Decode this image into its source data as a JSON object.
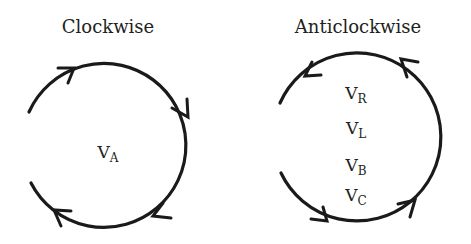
{
  "left_panel": {
    "title": "Clockwise",
    "direction": "clockwise",
    "labels": [
      {
        "main": "V",
        "sub": "A"
      }
    ]
  },
  "right_panel": {
    "title": "Anticlockwise",
    "direction": "anticlockwise",
    "labels": [
      {
        "main": "V",
        "sub": "R"
      },
      {
        "main": "V",
        "sub": "L"
      },
      {
        "main": "V",
        "sub": "B"
      },
      {
        "main": "V",
        "sub": "C"
      }
    ]
  },
  "colors": {
    "stroke": "#1a1a1a",
    "text": "#231f20",
    "background": "#ffffff"
  }
}
